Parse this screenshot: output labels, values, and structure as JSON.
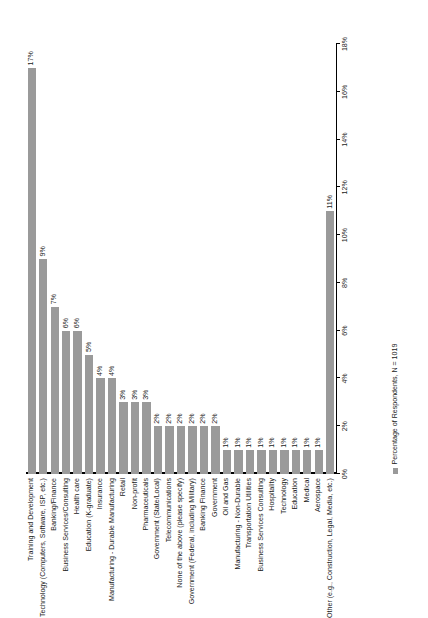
{
  "chart_data": {
    "type": "bar",
    "orientation": "horizontal",
    "title": "",
    "subtitle": "",
    "xlabel": "",
    "ylabel": "",
    "xlim": [
      0,
      18
    ],
    "grid": false,
    "legend_position": "bottom-left",
    "legend": [
      "Percentage of Respondents, N = 1019"
    ],
    "value_suffix": "%",
    "xticks": [
      0,
      2,
      4,
      6,
      8,
      10,
      12,
      14,
      16,
      18
    ],
    "xticklabels": [
      "0%",
      "2%",
      "4%",
      "6%",
      "8%",
      "10%",
      "12%",
      "14%",
      "16%",
      "18%"
    ],
    "categories": [
      "Training and Development",
      "Technology (Computers, Software, ISP, etc.)",
      "Banking/Finance",
      "Business Services/Consulting",
      "Health care",
      "Education (K-graduate)",
      "Insurance",
      "Manufacturing - Durable Manufacturing",
      "Retail",
      "Non-profit",
      "Pharmaceuticals",
      "Government (State/Local)",
      "Telecommunications",
      "None of the above (please specify)",
      "Government (Federal, including Military)",
      "Banking Finance",
      "Government",
      "Oil and Gas",
      "Manufacturing - Non-Durable",
      "Transportation Utilities",
      "Business Services Consulting",
      "Hospitality",
      "Technology",
      "Education",
      "Medical",
      "Aerospace",
      "Other (e.g., Construction, Legal, Media, etc.)"
    ],
    "values": [
      17,
      9,
      7,
      6,
      6,
      5,
      4,
      4,
      3,
      3,
      3,
      2,
      2,
      2,
      2,
      2,
      2,
      1,
      1,
      1,
      1,
      1,
      1,
      1,
      1,
      1,
      11
    ],
    "data_labels": [
      "17%",
      "9%",
      "7%",
      "6%",
      "6%",
      "5%",
      "4%",
      "4%",
      "3%",
      "3%",
      "3%",
      "2%",
      "2%",
      "2%",
      "2%",
      "2%",
      "2%",
      "1%",
      "1%",
      "1%",
      "1%",
      "1%",
      "1%",
      "1%",
      "1%",
      "1%",
      "11%"
    ],
    "colors": {
      "bar": "#9a9a9a",
      "axis": "#000000",
      "text": "#1a1a1a",
      "background": "#ffffff"
    }
  },
  "legend": {
    "series_label": "Percentage of Respondents, N = 1019",
    "swatch_color": "#9a9a9a"
  }
}
